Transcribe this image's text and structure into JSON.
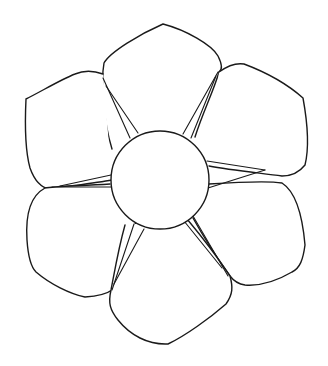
{
  "drawing": {
    "subject": "six-petal flower line drawing",
    "stroke_color": "#1a1a1a",
    "fill_color": "#ffffff",
    "background": "#ffffff",
    "center": {
      "cx": 160,
      "cy": 180,
      "r": 49
    },
    "petals": [
      {
        "name": "petal-top",
        "d": "M112,149 C103,120 101,80 104,63 C110,52 140,34 163,24 C186,30 212,45 218,56 C223,66 222,70 219,72 C214,90 203,112 195,137"
      },
      {
        "name": "petal-upper-left",
        "d": "M103,74 C92,70 82,71 75,74 C60,80 42,91 26,99 C25,120 25,150 30,168 C35,182 42,188 50,189 C70,186 95,183 112,180"
      },
      {
        "name": "petal-upper-right",
        "d": "M219,72 C230,64 238,63 244,64 C260,70 285,82 303,98 C307,120 310,145 305,165 C298,174 290,176 282,176 C260,173 230,170 209,166"
      },
      {
        "name": "petal-lower-left",
        "d": "M110,184 C80,186 55,186 45,188 C32,195 25,210 27,240 C28,255 30,266 36,272 C50,284 70,294 85,297 C100,296 108,293 112,290 C118,268 126,246 136,222"
      },
      {
        "name": "petal-lower-right",
        "d": "M209,184 C240,182 270,181 282,183 C293,190 302,210 305,245 C303,260 300,268 292,272 C275,282 258,286 245,285 C238,284 233,280 230,276 C220,262 208,245 193,218"
      },
      {
        "name": "petal-bottom",
        "d": "M125,225 C118,250 114,275 111,290 C108,303 110,310 118,320 C130,335 148,345 168,344 C185,336 210,318 226,304 C233,294 233,287 230,276 C218,258 203,238 187,219"
      }
    ],
    "spokes": [
      {
        "name": "spoke-top-left-a",
        "x1": 103,
        "y1": 78,
        "x2": 130,
        "y2": 138
      },
      {
        "name": "spoke-top-left-b",
        "x1": 106,
        "y1": 86,
        "x2": 138,
        "y2": 133
      },
      {
        "name": "spoke-top-right-a",
        "x1": 218,
        "y1": 72,
        "x2": 183,
        "y2": 134
      },
      {
        "name": "spoke-top-right-b",
        "x1": 216,
        "y1": 76,
        "x2": 191,
        "y2": 138
      },
      {
        "name": "spoke-left-a",
        "x1": 60,
        "y1": 186,
        "x2": 111,
        "y2": 175
      },
      {
        "name": "spoke-left-b",
        "x1": 52,
        "y1": 187,
        "x2": 111,
        "y2": 187
      },
      {
        "name": "spoke-right-a",
        "x1": 207,
        "y1": 161,
        "x2": 265,
        "y2": 170
      },
      {
        "name": "spoke-right-b",
        "x1": 208,
        "y1": 188,
        "x2": 265,
        "y2": 170
      },
      {
        "name": "spoke-bottom-left-a",
        "x1": 134,
        "y1": 224,
        "x2": 112,
        "y2": 290
      },
      {
        "name": "spoke-bottom-left-b",
        "x1": 144,
        "y1": 229,
        "x2": 114,
        "y2": 284
      },
      {
        "name": "spoke-bottom-right-a",
        "x1": 184,
        "y1": 221,
        "x2": 222,
        "y2": 268
      },
      {
        "name": "spoke-bottom-right-b",
        "x1": 193,
        "y1": 216,
        "x2": 228,
        "y2": 276
      }
    ]
  }
}
